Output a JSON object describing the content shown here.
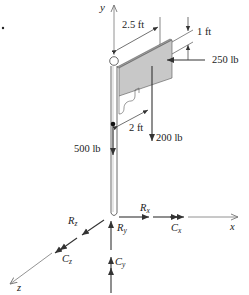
{
  "figure": {
    "type": "3D free-body diagram of a sign post",
    "colors": {
      "line": "#333333",
      "axis": "#777777",
      "sign_face": "#c8c8c8",
      "sign_edge": "#9a9a9a",
      "background": "#ffffff"
    }
  },
  "axes": {
    "x_label": "x",
    "y_label": "y",
    "z_label": "z"
  },
  "dimensions": {
    "width_label": "2.5 ft",
    "height_label": "1 ft",
    "offset_label": "2 ft"
  },
  "loads": {
    "wind_load": "250 lb",
    "sign_weight": "200 lb",
    "pole_weight": "500 lb"
  },
  "reactions": {
    "rx": "R",
    "rx_sub": "x",
    "ry": "R",
    "ry_sub": "y",
    "rz": "R",
    "rz_sub": "z",
    "cx": "C",
    "cx_sub": "x",
    "cy": "C",
    "cy_sub": "y",
    "cz": "C",
    "cz_sub": "z"
  }
}
